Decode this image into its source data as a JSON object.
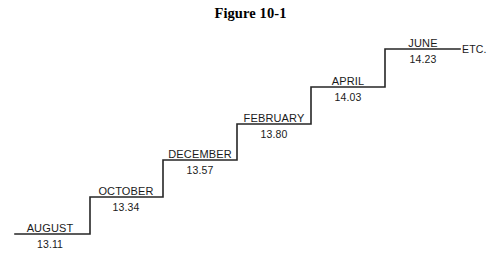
{
  "figure": {
    "title": "Figure 10-1",
    "background_color": "#ffffff",
    "line_color": "#262626",
    "text_color": "#1a1a1a"
  },
  "chart_data": {
    "type": "line",
    "title": "Figure 10-1",
    "subtype": "step",
    "categories": [
      "AUGUST",
      "OCTOBER",
      "DECEMBER",
      "FEBRUARY",
      "APRIL",
      "JUNE"
    ],
    "values": [
      13.11,
      13.34,
      13.57,
      13.8,
      14.03,
      14.23
    ],
    "value_labels": [
      "13.11",
      "13.34",
      "13.57",
      "13.80",
      "14.03",
      "14.23"
    ],
    "xlabel": "",
    "ylabel": "",
    "ylim": [
      13.0,
      14.35
    ],
    "grid": false,
    "legend": false,
    "annotations": [
      {
        "text": "ETC.",
        "position": "right-end-of-last-step"
      }
    ],
    "steps": [
      {
        "label": "AUGUST",
        "value": "13.11",
        "x_start": 15,
        "x_end": 90,
        "y": 234,
        "label_x": 50,
        "label_y": 222,
        "value_x": 50,
        "value_y": 238
      },
      {
        "label": "OCTOBER",
        "value": "13.34",
        "x_start": 90,
        "x_end": 163,
        "y": 197,
        "label_x": 126,
        "label_y": 185,
        "value_x": 126,
        "value_y": 201
      },
      {
        "label": "DECEMBER",
        "value": "13.57",
        "x_start": 163,
        "x_end": 237,
        "y": 160,
        "label_x": 200,
        "label_y": 148,
        "value_x": 200,
        "value_y": 164
      },
      {
        "label": "FEBRUARY",
        "value": "13.80",
        "x_start": 237,
        "x_end": 311,
        "y": 124,
        "label_x": 274,
        "label_y": 112,
        "value_x": 274,
        "value_y": 128
      },
      {
        "label": "APRIL",
        "value": "14.03",
        "x_start": 311,
        "x_end": 385,
        "y": 87,
        "label_x": 348,
        "label_y": 75,
        "value_x": 348,
        "value_y": 91
      },
      {
        "label": "JUNE",
        "value": "14.23",
        "x_start": 385,
        "x_end": 460,
        "y": 49,
        "label_x": 423,
        "label_y": 37,
        "value_x": 423,
        "value_y": 53
      }
    ],
    "etc": {
      "text": "ETC.",
      "x": 462,
      "y": 43
    }
  }
}
